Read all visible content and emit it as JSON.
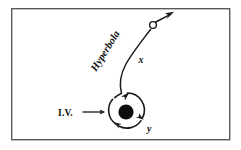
{
  "figure": {
    "background_color": "#ffffff",
    "frame": {
      "name": "border-frame",
      "x": 11,
      "y": 8,
      "width": 219,
      "height": 132,
      "stroke_color": "#5a5a5a",
      "stroke_width": 1.4
    },
    "labels": {
      "initial_velocity": "I.V.",
      "trajectory": "Hyperbola",
      "axis_x": "x",
      "axis_y": "y"
    },
    "colors": {
      "ink": "#1a1a1a",
      "frame": "#5a5a5a",
      "body_fill": "#0d0d0d",
      "paper": "#ffffff"
    },
    "elements": {
      "central_body": {
        "name": "central-body-disk",
        "cx": 126,
        "cy": 112,
        "r": 7.5,
        "fill": "#0d0d0d"
      },
      "circular_orbit": {
        "name": "circular-orbit",
        "cx": 126,
        "cy": 110,
        "r": 17,
        "direction": "clockwise",
        "arrowhead_count": 3
      },
      "escape_marker": {
        "name": "escaping-object-marker",
        "cx": 153,
        "cy": 25,
        "r": 3.4,
        "style": "open-circle"
      },
      "trajectory_arrow_tip": {
        "name": "trajectory-arrowhead",
        "x": 173,
        "y": 13,
        "angle_deg": -32
      },
      "iv_arrow": {
        "name": "initial-velocity-arrow",
        "x1": 82,
        "y1": 112,
        "x2": 104,
        "y2": 112,
        "direction": "right"
      }
    },
    "label_positions": {
      "initial_velocity": {
        "x": 58,
        "y": 116,
        "rotation": 0
      },
      "trajectory": {
        "x": 96,
        "y": 72,
        "rotation": -58
      },
      "axis_x": {
        "x": 139,
        "y": 62,
        "rotation": 0
      },
      "axis_y": {
        "x": 148,
        "y": 131,
        "rotation": 0
      }
    }
  }
}
